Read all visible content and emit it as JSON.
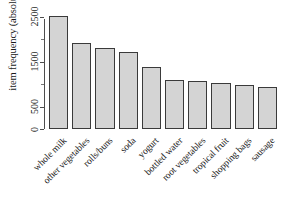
{
  "chart_data": {
    "type": "bar",
    "title": "",
    "subtitle": "",
    "xlabel": "",
    "ylabel": "item frequency (absolute)",
    "categories": [
      "whole milk",
      "other vegetables",
      "rolls/buns",
      "soda",
      "yogurt",
      "bottled water",
      "root vegetables",
      "tropical fruit",
      "shopping bags",
      "sausage"
    ],
    "values": [
      2513,
      1903,
      1809,
      1715,
      1372,
      1087,
      1072,
      1032,
      969,
      924
    ],
    "ylim": [
      0,
      2600
    ],
    "ytick_values": [
      0,
      500,
      1500,
      2500
    ],
    "ytick_labels": [
      "0",
      "500",
      "1500",
      "2500"
    ],
    "yminor_tick_values": [
      1000,
      2000
    ],
    "grid": false,
    "legend": false,
    "legend_position": "none",
    "bar_fill_color": "#d4d4d4",
    "bar_border_color": "#3a3a3a",
    "axis_color": "#4d4d4d",
    "text_color": "#1a1a1a",
    "background_color": "#ffffff"
  }
}
